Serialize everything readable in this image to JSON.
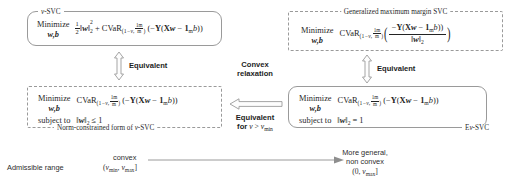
{
  "diagram": {
    "boxes": {
      "nu_svc": {
        "label": "ν-SVC",
        "minimize_word": "Minimize",
        "minimize_vars": "w,b",
        "objective_plain": "½‖w‖²₂ + CVaR₍₁₋ν, 1m/m₎(−Y(Xw − 1ₘb))",
        "half_num": "1",
        "half_den": "2",
        "norm_open": "‖",
        "norm_var": "w",
        "norm_close": "‖",
        "norm_sup": "2",
        "norm_sub": "2",
        "plus": "+",
        "cvar": "CVaR",
        "cvar_sub_left": "(1 − ν, ",
        "cvar_sub_frac_n": "1m",
        "cvar_sub_frac_d": "m",
        "cvar_sub_right": ")",
        "arg": "(−Y(Xw − 1ₘb))"
      },
      "gen_max_margin": {
        "label": "Generalized maximum margin SVC",
        "minimize_word": "Minimize",
        "minimize_vars": "w,b",
        "cvar": "CVaR",
        "cvar_sub_left": "(1 − ν, ",
        "cvar_sub_frac_n": "1m",
        "cvar_sub_frac_d": "m",
        "cvar_sub_right": ")",
        "frac_num": "−Y(Xw − 1ₘb))",
        "frac_den": "‖w‖₂"
      },
      "norm_constrained": {
        "label": "Norm-constrained form of ν-SVC",
        "minimize_word": "Minimize",
        "minimize_vars": "w,b",
        "subject_to": "subject to",
        "cvar": "CVaR",
        "cvar_sub_left": "(1 − ν, ",
        "cvar_sub_frac_n": "1m",
        "cvar_sub_frac_d": "m",
        "cvar_sub_right": ")",
        "arg": "(−Y(Xw − 1ₘb))",
        "constraint": "‖w‖₂ ≤ 1"
      },
      "enu_svc": {
        "label": "Eν-SVC",
        "minimize_word": "Minimize",
        "minimize_vars": "w,b",
        "subject_to": "subject to",
        "cvar": "CVaR",
        "cvar_sub_left": "(1 − ν, ",
        "cvar_sub_frac_n": "1m",
        "cvar_sub_frac_d": "m",
        "cvar_sub_right": ")",
        "arg": "(−Y(Xw − 1ₘb))",
        "constraint": "‖w‖₂ = 1"
      }
    },
    "connectors": {
      "left_vertical": "Equivalent",
      "right_vertical": "Equivalent",
      "convex_relaxation_line1": "Convex",
      "convex_relaxation_line2": "relaxation",
      "equivalent_for_line1": "Equivalent",
      "equivalent_for_line2_bold": "for ",
      "equivalent_for_line2_math": "ν > ν",
      "equivalent_for_line2_sub": "min"
    },
    "axis": {
      "admissible_range": "Admissible range",
      "left_top": "convex",
      "left_interval_open": "(ν",
      "left_interval_sub1": "min",
      "left_interval_mid": ", ν",
      "left_interval_sub2": "max",
      "left_interval_close": "]",
      "right_line1": "More general,",
      "right_line2": "non convex",
      "right_interval_open": "(0, ν",
      "right_interval_sub": "max",
      "right_interval_close": "]"
    },
    "colors": {
      "background": "#ffffff",
      "box_border": "#9a9a9a",
      "text": "#232323",
      "arrow_stroke": "#8e8e8e",
      "arrow_fill": "#fdfdfd"
    }
  }
}
